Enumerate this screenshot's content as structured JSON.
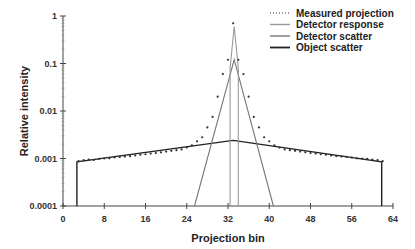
{
  "chart_data": {
    "type": "line",
    "title": "",
    "xlabel": "Projection bin",
    "ylabel": "Relative intensity",
    "xlim": [
      0,
      64
    ],
    "ylim": [
      0.0001,
      1
    ],
    "yscale": "log",
    "grid": false,
    "legend_position": "top-right",
    "xticks": [
      "0",
      "8",
      "16",
      "24",
      "32",
      "40",
      "48",
      "56",
      "64"
    ],
    "xtick_values": [
      0,
      8,
      16,
      24,
      32,
      40,
      48,
      56,
      64
    ],
    "yticks": [
      "1",
      "0.1",
      "0.01",
      "0.001",
      "0.0001"
    ],
    "ytick_values": [
      1,
      0.1,
      0.01,
      0.001,
      0.0001
    ],
    "series": [
      {
        "name": "Measured projection",
        "style": "dotted",
        "color": "#333333",
        "x": [
          3,
          4,
          5,
          6,
          7,
          8,
          9,
          10,
          11,
          12,
          13,
          14,
          15,
          16,
          17,
          18,
          19,
          20,
          21,
          22,
          23,
          24,
          25,
          26,
          27,
          28,
          29,
          30,
          31,
          32,
          33,
          34,
          35,
          36,
          37,
          38,
          39,
          40,
          41,
          42,
          43,
          44,
          45,
          46,
          47,
          48,
          49,
          50,
          51,
          52,
          53,
          54,
          55,
          56,
          57,
          58,
          59,
          60,
          61,
          62
        ],
        "y": [
          0.00088,
          0.00092,
          0.00095,
          0.00093,
          0.00098,
          0.001,
          0.00101,
          0.00105,
          0.00108,
          0.0011,
          0.00112,
          0.00116,
          0.0012,
          0.00123,
          0.00127,
          0.0013,
          0.00135,
          0.0014,
          0.00145,
          0.0015,
          0.00155,
          0.0017,
          0.0019,
          0.0023,
          0.0028,
          0.0045,
          0.0075,
          0.02,
          0.06,
          0.12,
          0.7,
          0.12,
          0.06,
          0.02,
          0.0075,
          0.0045,
          0.0028,
          0.0023,
          0.0019,
          0.0017,
          0.00155,
          0.0015,
          0.00145,
          0.0014,
          0.00135,
          0.0013,
          0.00127,
          0.00123,
          0.0012,
          0.00116,
          0.00112,
          0.0011,
          0.00108,
          0.00105,
          0.00101,
          0.001,
          0.00098,
          0.00095,
          0.00092,
          0.00088
        ]
      },
      {
        "name": "Detector response",
        "style": "solid",
        "color": "#999999",
        "x": [
          32.4,
          32.4,
          33.2,
          34.0,
          34.0
        ],
        "y": [
          0.0001,
          0.08,
          0.6,
          0.08,
          0.0001
        ]
      },
      {
        "name": "Detector scatter",
        "style": "solid",
        "color": "#777777",
        "x": [
          25.5,
          33.2,
          40.8
        ],
        "y": [
          0.0001,
          0.12,
          0.0001
        ]
      },
      {
        "name": "Object scatter",
        "style": "solid",
        "color": "#222222",
        "x": [
          2.7,
          2.7,
          33.0,
          61.8,
          61.8
        ],
        "y": [
          0.0001,
          0.00085,
          0.0024,
          0.00085,
          0.0001
        ]
      }
    ]
  }
}
